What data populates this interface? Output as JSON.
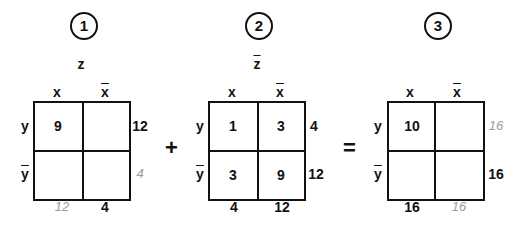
{
  "maps": [
    {
      "number": "1",
      "title": "z",
      "col_labels": [
        "x",
        "x"
      ],
      "row_labels": [
        "y",
        "y"
      ],
      "cells": [
        [
          "9",
          ""
        ],
        [
          "",
          ""
        ]
      ],
      "row_totals": [
        "12",
        ""
      ],
      "col_totals": [
        "",
        "4"
      ],
      "handwritten": {
        "row_total_2": "4",
        "col_total_1": "12"
      }
    },
    {
      "number": "2",
      "title": "z",
      "col_labels": [
        "x",
        "x"
      ],
      "row_labels": [
        "y",
        "y"
      ],
      "cells": [
        [
          "1",
          "3"
        ],
        [
          "3",
          "9"
        ]
      ],
      "row_totals": [
        "4",
        "12"
      ],
      "col_totals": [
        "4",
        "12"
      ]
    },
    {
      "number": "3",
      "title": "",
      "col_labels": [
        "x",
        "x"
      ],
      "row_labels": [
        "y",
        "y"
      ],
      "cells": [
        [
          "10",
          ""
        ],
        [
          "",
          ""
        ]
      ],
      "row_totals": [
        "",
        "16"
      ],
      "col_totals": [
        "16",
        ""
      ],
      "handwritten": {
        "row_total_1": "16",
        "col_total_2": "16"
      }
    }
  ],
  "operators": {
    "plus": "+",
    "equals": "="
  }
}
